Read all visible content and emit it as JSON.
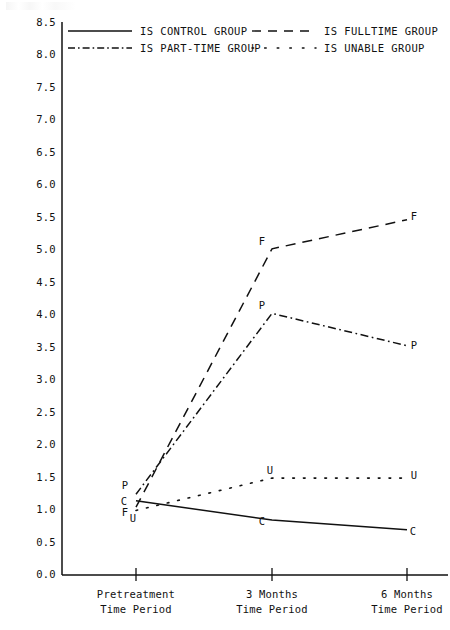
{
  "legend": {
    "position": "top",
    "entries": [
      {
        "label": "IS CONTROL GROUP",
        "style": "solid",
        "marker": "C"
      },
      {
        "label": "IS FULLTIME GROUP",
        "style": "dashed",
        "marker": "F"
      },
      {
        "label": "IS PART-TIME GROUP",
        "style": "dash-dot",
        "marker": "P"
      },
      {
        "label": "IS UNABLE GROUP",
        "style": "dotted",
        "marker": "U"
      }
    ]
  },
  "chart_data": {
    "type": "line",
    "title": "",
    "xlabel": "",
    "ylabel": "",
    "grid": false,
    "categories": [
      "Pretreatment\nTime Period",
      "3 Months\nTime Period",
      "6 Months\nTime Period"
    ],
    "category_lines": [
      [
        "Pretreatment",
        "Time Period"
      ],
      [
        "3 Months",
        "Time Period"
      ],
      [
        "6 Months",
        "Time Period"
      ]
    ],
    "ylim": [
      0.0,
      8.5
    ],
    "ytick_labels": [
      "0.0",
      "0.5",
      "1.0",
      "1.5",
      "2.0",
      "2.5",
      "3.0",
      "3.5",
      "4.0",
      "4.5",
      "5.0",
      "5.5",
      "6.0",
      "6.5",
      "7.0",
      "7.5",
      "8.0",
      "8.5"
    ],
    "ytick_values": [
      0.0,
      0.5,
      1.0,
      1.5,
      2.0,
      2.5,
      3.0,
      3.5,
      4.0,
      4.5,
      5.0,
      5.5,
      6.0,
      6.5,
      7.0,
      7.5,
      8.0,
      8.5
    ],
    "series": [
      {
        "name": "IS CONTROL GROUP",
        "style": "solid",
        "marker": "C",
        "values": [
          1.15,
          0.85,
          0.7
        ]
      },
      {
        "name": "IS FULLTIME GROUP",
        "style": "dashed",
        "marker": "F",
        "values": [
          1.05,
          5.05,
          5.5
        ]
      },
      {
        "name": "IS PART-TIME GROUP",
        "style": "dash-dot",
        "marker": "P",
        "values": [
          1.25,
          4.05,
          3.55
        ]
      },
      {
        "name": "IS UNABLE GROUP",
        "style": "dotted",
        "marker": "U",
        "values": [
          1.0,
          1.5,
          1.5
        ]
      }
    ],
    "point_labels": {
      "pretreatment": [
        "P",
        "C",
        "F",
        "U"
      ],
      "three_months": [
        "F",
        "P",
        "U",
        "C"
      ],
      "six_months": [
        "F",
        "P",
        "U",
        "C"
      ]
    }
  }
}
